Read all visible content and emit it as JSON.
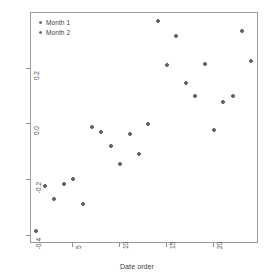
{
  "chart_data": {
    "type": "scatter",
    "title": "",
    "xlabel": "Date order",
    "ylabel": "First PC",
    "xlim": [
      0.5,
      24.8
    ],
    "ylim": [
      -0.43,
      0.4
    ],
    "grid": false,
    "legend_position": "top-left",
    "x_ticks": [
      5,
      10,
      15,
      20
    ],
    "y_ticks": [
      0.2,
      0.0,
      -0.2,
      -0.4
    ],
    "y_tick_labels": [
      "0.2",
      "0.0",
      "-0.2",
      "-0.4"
    ],
    "x_tick_labels": [
      "5",
      "10",
      "15",
      "20"
    ],
    "series": [
      {
        "name": "Month 1",
        "marker": "circle",
        "color": "#6e6e6e",
        "points": [
          {
            "x": 1,
            "y": -0.385
          },
          {
            "x": 2,
            "y": -0.222
          },
          {
            "x": 3,
            "y": -0.268
          },
          {
            "x": 4,
            "y": -0.214
          },
          {
            "x": 5,
            "y": -0.196
          },
          {
            "x": 6,
            "y": -0.288
          },
          {
            "x": 7,
            "y": -0.008
          },
          {
            "x": 8,
            "y": -0.026
          },
          {
            "x": 9,
            "y": -0.077
          },
          {
            "x": 10,
            "y": -0.142
          },
          {
            "x": 11,
            "y": -0.036
          },
          {
            "x": 12,
            "y": -0.108
          }
        ]
      },
      {
        "name": "Month 2",
        "marker": "circle",
        "color": "#6e6e6e",
        "points": [
          {
            "x": 13,
            "y": 0.002
          },
          {
            "x": 14,
            "y": 0.372
          },
          {
            "x": 15,
            "y": 0.212
          },
          {
            "x": 16,
            "y": 0.318
          },
          {
            "x": 17,
            "y": 0.148
          },
          {
            "x": 18,
            "y": 0.102
          },
          {
            "x": 19,
            "y": 0.216
          },
          {
            "x": 20,
            "y": -0.022
          },
          {
            "x": 21,
            "y": 0.082
          },
          {
            "x": 22,
            "y": 0.1
          },
          {
            "x": 23,
            "y": 0.336
          },
          {
            "x": 24,
            "y": 0.226
          }
        ]
      }
    ]
  },
  "legend": {
    "items": [
      {
        "label": "Month 1"
      },
      {
        "label": "Month 2"
      }
    ]
  }
}
